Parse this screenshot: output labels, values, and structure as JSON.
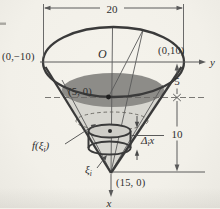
{
  "figure": {
    "colors": {
      "background": "#f2f0e9",
      "heavy_line": "#3a3a3a",
      "thin_line": "#5a5a5a",
      "water_surface": "#8d8c88",
      "cone_body": "#d7d6d0",
      "disk_top": "#cecdc7",
      "text": "#2e2e2e"
    },
    "dimensions": {
      "top_width": "20",
      "upper_depth": "5",
      "lower_depth": "10"
    },
    "axes": {
      "origin": "O",
      "y_label": "y",
      "x_label": "x"
    },
    "points": {
      "left_rim": "(0,−10)",
      "right_rim": "(0,10)",
      "water_level": "(5, 0)",
      "apex": "(15, 0)"
    },
    "element_labels": {
      "radius": {
        "pre": "f(ξ",
        "sub": "i",
        "post": ")"
      },
      "depth": {
        "pre": "ξ",
        "sub": "i"
      },
      "thickness": {
        "pre": "Δ",
        "sub": "i",
        "post": "x"
      }
    }
  }
}
